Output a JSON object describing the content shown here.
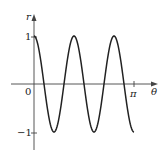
{
  "chart_data": {
    "type": "line",
    "title": "",
    "function": "r = cos(5θ)",
    "xlabel": "θ",
    "ylabel": "r",
    "x_ticks": [
      {
        "value": 0,
        "label": "0"
      },
      {
        "value": 3.14159,
        "label": "π"
      }
    ],
    "y_ticks": [
      {
        "value": 1,
        "label": "1"
      },
      {
        "value": -1,
        "label": "−1"
      }
    ],
    "xlim": [
      0,
      3.14159
    ],
    "ylim": [
      -1,
      1
    ],
    "grid": false,
    "legend": null,
    "series": [
      {
        "name": "r",
        "x": [
          0,
          0.3142,
          0.6283,
          0.9425,
          1.2566,
          1.5708,
          1.885,
          2.1991,
          2.5133,
          2.8274,
          3.1416
        ],
        "values": [
          1,
          0,
          -1,
          0,
          1,
          0,
          -1,
          0,
          1,
          0,
          -1
        ]
      }
    ],
    "color": "#222222"
  },
  "labels": {
    "y_axis": "r",
    "x_axis": "θ",
    "origin": "0",
    "y_one": "1",
    "y_neg_one": "−1",
    "x_pi": "π"
  }
}
